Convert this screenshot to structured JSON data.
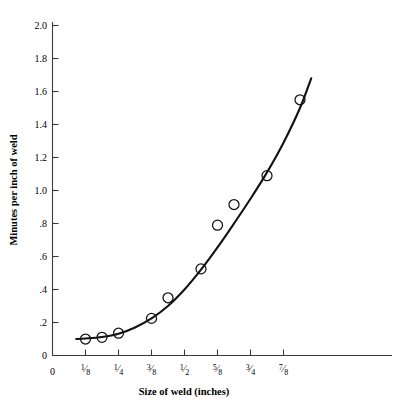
{
  "chart_data": {
    "type": "scatter",
    "title": "",
    "subtitle": "",
    "xlabel": "Size of weld (inches)",
    "ylabel": "Minutes per inch of weld",
    "xlim": [
      0,
      1.0
    ],
    "ylim": [
      0,
      2.1
    ],
    "grid": false,
    "legend": null,
    "x_tick_labels": [
      "0",
      "1/8",
      "1/4",
      "3/8",
      "1/2",
      "5/8",
      "3/4",
      "7/8"
    ],
    "x_tick_values": [
      0,
      0.125,
      0.25,
      0.375,
      0.5,
      0.625,
      0.75,
      0.875
    ],
    "y_tick_labels": [
      "0",
      ".2",
      ".4",
      ".6",
      ".8",
      "1.0",
      "1.2",
      "1.4",
      "1.6",
      "1.8",
      "2.0"
    ],
    "y_tick_values": [
      0,
      0.2,
      0.4,
      0.6,
      0.8,
      1.0,
      1.2,
      1.4,
      1.6,
      1.8,
      2.0
    ],
    "series": [
      {
        "name": "observed",
        "marker": "open-circle",
        "x": [
          0.125,
          0.1875,
          0.25,
          0.375,
          0.4375,
          0.5625,
          0.625,
          0.6875,
          0.8125,
          0.9375
        ],
        "y": [
          0.1,
          0.11,
          0.135,
          0.225,
          0.35,
          0.525,
          0.79,
          0.915,
          1.09,
          1.55
        ]
      },
      {
        "name": "fitted-curve",
        "marker": "line",
        "x": [
          0.09,
          0.125,
          0.1875,
          0.25,
          0.3125,
          0.375,
          0.4375,
          0.5,
          0.5625,
          0.625,
          0.6875,
          0.75,
          0.8125,
          0.875,
          0.9375,
          0.98
        ],
        "y": [
          0.1,
          0.103,
          0.112,
          0.132,
          0.17,
          0.225,
          0.3,
          0.4,
          0.52,
          0.655,
          0.8,
          0.95,
          1.11,
          1.29,
          1.5,
          1.68
        ]
      }
    ],
    "colors": {
      "axis": "#3b3b3b",
      "curve": "#121212",
      "marker": "#121212",
      "background": "#ffffff"
    }
  },
  "axis_titles": {
    "x": "Size of weld (inches)",
    "y": "Minutes per inch of weld"
  },
  "y_labels": {
    "l0": "0",
    "l1": ".2",
    "l2": ".4",
    "l3": ".6",
    "l4": ".8",
    "l5": "1.0",
    "l6": "1.2",
    "l7": "1.4",
    "l8": "1.6",
    "l9": "1.8",
    "l10": "2.0"
  },
  "x_labels": {
    "zero": "0",
    "fractions": [
      {
        "num": "1",
        "den": "8"
      },
      {
        "num": "1",
        "den": "4"
      },
      {
        "num": "3",
        "den": "8"
      },
      {
        "num": "1",
        "den": "2"
      },
      {
        "num": "5",
        "den": "8"
      },
      {
        "num": "3",
        "den": "4"
      },
      {
        "num": "7",
        "den": "8"
      }
    ]
  }
}
